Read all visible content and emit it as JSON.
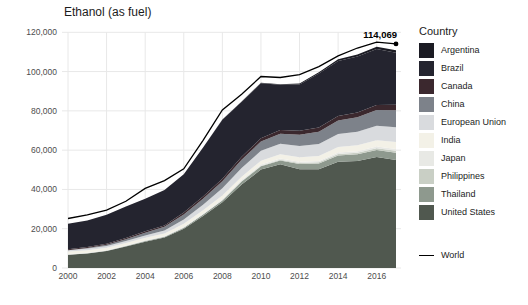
{
  "title": "Ethanol (as fuel)",
  "annotation": {
    "end_label": "114,069"
  },
  "legend": {
    "title": "Country",
    "world_label": "World"
  },
  "colors": {
    "background": "#ffffff",
    "grid": "#e8e8e8",
    "axis_text": "#4d4d4d",
    "title_text": "#1c1c1c",
    "world_line": "#000000"
  },
  "chart_data": {
    "type": "area",
    "stacked": true,
    "title": "Ethanol (as fuel)",
    "xlabel": "",
    "ylabel": "",
    "xlim": [
      2000,
      2017
    ],
    "ylim": [
      0,
      120000
    ],
    "xticks": [
      2000,
      2002,
      2004,
      2006,
      2008,
      2010,
      2012,
      2014,
      2016
    ],
    "yticks": [
      0,
      20000,
      40000,
      60000,
      80000,
      100000,
      120000
    ],
    "grid": true,
    "legend_position": "right",
    "legend_title": "Country",
    "stack_note": "series listed in legend order top-to-bottom; United States is the bottom band",
    "x": [
      2000,
      2001,
      2002,
      2003,
      2004,
      2005,
      2006,
      2007,
      2008,
      2009,
      2010,
      2011,
      2012,
      2013,
      2014,
      2015,
      2016,
      2017
    ],
    "series": [
      {
        "name": "Argentina",
        "color": "#1b1b23",
        "values": [
          0,
          0,
          0,
          0,
          0,
          0,
          0,
          0,
          100,
          200,
          200,
          300,
          500,
          700,
          900,
          1000,
          1100,
          1200
        ]
      },
      {
        "name": "Brazil",
        "color": "#24242f",
        "values": [
          12900,
          13500,
          14700,
          16000,
          16500,
          18000,
          19500,
          25000,
          30000,
          28000,
          28000,
          23000,
          23500,
          27500,
          28000,
          28500,
          28500,
          26500
        ]
      },
      {
        "name": "Canada",
        "color": "#3b282e",
        "values": [
          500,
          500,
          600,
          600,
          700,
          700,
          900,
          1100,
          1300,
          1500,
          1700,
          1900,
          2000,
          2100,
          2300,
          2400,
          2600,
          2800
        ]
      },
      {
        "name": "China",
        "color": "#7d828a",
        "values": [
          0,
          300,
          600,
          1000,
          1400,
          1900,
          2600,
          3100,
          3600,
          4200,
          4700,
          5200,
          5800,
          6300,
          6900,
          7400,
          8000,
          8600
        ]
      },
      {
        "name": "European Union",
        "color": "#d9dbde",
        "values": [
          700,
          800,
          900,
          1000,
          1200,
          1500,
          2200,
          2800,
          3700,
          4400,
          5100,
          5300,
          5700,
          6100,
          6600,
          6900,
          7300,
          7600
        ]
      },
      {
        "name": "India",
        "color": "#f3f1e7",
        "values": [
          1300,
          1300,
          1200,
          1200,
          1300,
          1300,
          1500,
          1700,
          1800,
          1600,
          1900,
          2100,
          2300,
          2500,
          2800,
          3000,
          3200,
          3500
        ]
      },
      {
        "name": "Japan",
        "color": "#e8e9e5",
        "values": [
          300,
          300,
          300,
          300,
          400,
          400,
          500,
          500,
          600,
          600,
          600,
          700,
          700,
          700,
          800,
          800,
          900,
          900
        ]
      },
      {
        "name": "Philippines",
        "color": "#c9cfc5",
        "values": [
          0,
          0,
          0,
          0,
          0,
          0,
          0,
          0,
          100,
          200,
          300,
          400,
          500,
          600,
          700,
          800,
          900,
          1000
        ]
      },
      {
        "name": "Thailand",
        "color": "#8e998e",
        "values": [
          100,
          100,
          200,
          300,
          300,
          400,
          500,
          700,
          900,
          1600,
          1700,
          1900,
          2600,
          2900,
          3200,
          3400,
          3600,
          3700
        ]
      },
      {
        "name": "United States",
        "color": "#50584f",
        "values": [
          6700,
          7400,
          8600,
          10900,
          13400,
          15500,
          20000,
          26500,
          33500,
          42500,
          50100,
          52800,
          50300,
          50300,
          54100,
          54500,
          56500,
          55000
        ]
      }
    ],
    "line_series": {
      "name": "World",
      "color": "#000000",
      "values": [
        25200,
        27000,
        29500,
        34000,
        40500,
        44500,
        50500,
        65000,
        80500,
        88500,
        97500,
        97000,
        98500,
        102500,
        108000,
        112000,
        115000,
        114069
      ],
      "end_label": "114,069",
      "end_point": {
        "x": 2017,
        "y": 114069
      }
    }
  }
}
